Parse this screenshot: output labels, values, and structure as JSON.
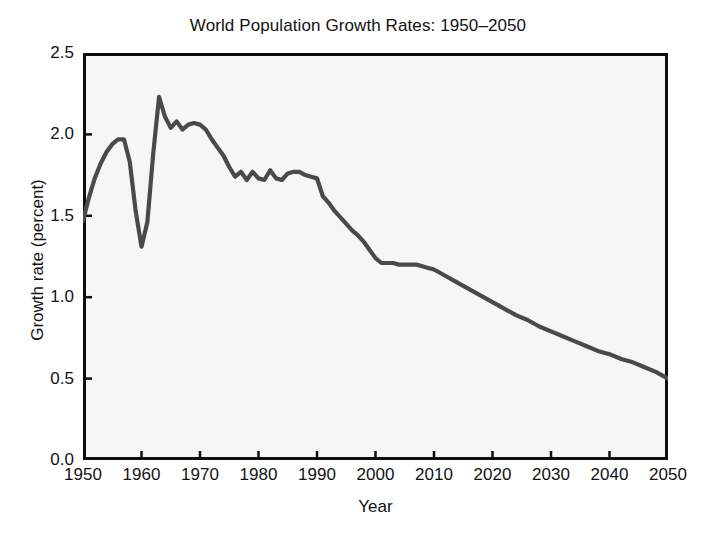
{
  "chart_data": {
    "type": "line",
    "title": "World Population Growth Rates: 1950–2050",
    "xlabel": "Year",
    "ylabel": "Growth rate (percent)",
    "xlim": [
      1950,
      2050
    ],
    "ylim": [
      0.0,
      2.5
    ],
    "grid": false,
    "legend": null,
    "line_color": "#4a4a4a",
    "plot_background": "#f6f6f6",
    "frame_color": "#0e0e0e",
    "xticks": [
      1950,
      1960,
      1970,
      1980,
      1990,
      2000,
      2010,
      2020,
      2030,
      2040,
      2050
    ],
    "xtick_labels": [
      "1950",
      "1960",
      "1970",
      "1980",
      "1990",
      "2000",
      "2010",
      "2020",
      "2030",
      "2040",
      "2050"
    ],
    "yticks": [
      0.0,
      0.5,
      1.0,
      1.5,
      2.0,
      2.5
    ],
    "ytick_labels": [
      "0.0",
      "0.5",
      "1.0",
      "1.5",
      "2.0",
      "2.5"
    ],
    "series": [
      {
        "name": "World population growth rate",
        "x": [
          1950,
          1951,
          1952,
          1953,
          1954,
          1955,
          1956,
          1957,
          1958,
          1959,
          1960,
          1961,
          1962,
          1963,
          1964,
          1965,
          1966,
          1967,
          1968,
          1969,
          1970,
          1971,
          1972,
          1973,
          1974,
          1975,
          1976,
          1977,
          1978,
          1979,
          1980,
          1981,
          1982,
          1983,
          1984,
          1985,
          1986,
          1987,
          1988,
          1989,
          1990,
          1991,
          1992,
          1993,
          1994,
          1995,
          1996,
          1997,
          1998,
          1999,
          2000,
          2001,
          2002,
          2003,
          2004,
          2005,
          2006,
          2007,
          2008,
          2009,
          2010,
          2012,
          2014,
          2016,
          2018,
          2020,
          2022,
          2024,
          2026,
          2028,
          2030,
          2032,
          2034,
          2036,
          2038,
          2040,
          2042,
          2044,
          2046,
          2048,
          2050
        ],
        "y": [
          1.47,
          1.61,
          1.73,
          1.82,
          1.89,
          1.94,
          1.97,
          1.97,
          1.83,
          1.53,
          1.31,
          1.46,
          1.88,
          2.23,
          2.11,
          2.04,
          2.08,
          2.03,
          2.06,
          2.07,
          2.06,
          2.03,
          1.97,
          1.92,
          1.87,
          1.8,
          1.74,
          1.77,
          1.72,
          1.77,
          1.73,
          1.72,
          1.78,
          1.73,
          1.72,
          1.76,
          1.77,
          1.77,
          1.75,
          1.74,
          1.73,
          1.62,
          1.58,
          1.53,
          1.49,
          1.45,
          1.41,
          1.38,
          1.34,
          1.29,
          1.24,
          1.21,
          1.21,
          1.21,
          1.2,
          1.2,
          1.2,
          1.2,
          1.19,
          1.18,
          1.17,
          1.13,
          1.09,
          1.05,
          1.01,
          0.97,
          0.93,
          0.89,
          0.86,
          0.82,
          0.79,
          0.76,
          0.73,
          0.7,
          0.67,
          0.65,
          0.62,
          0.6,
          0.57,
          0.54,
          0.5
        ]
      }
    ],
    "annotations": [
      {
        "label": "post-war rise peak",
        "x": 1957,
        "y": 1.97
      },
      {
        "label": "Great Leap Forward trough",
        "x": 1960,
        "y": 1.31
      },
      {
        "label": "all-time peak",
        "x": 1963,
        "y": 2.23
      },
      {
        "label": "1980s plateau",
        "x": 1987,
        "y": 1.77
      },
      {
        "label": "projection endpoint",
        "x": 2050,
        "y": 0.5
      }
    ]
  }
}
